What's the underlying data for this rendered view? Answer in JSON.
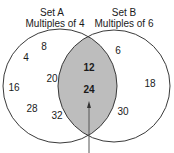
{
  "colors": {
    "circle_stroke": "#3a3a3a",
    "intersection_fill": "#bdbdbd",
    "background": "#ffffff",
    "arrow": "#555555"
  },
  "set_a": {
    "name": "Set A",
    "description": "Multiples of 4",
    "only_values": [
      "8",
      "4",
      "20",
      "16",
      "28",
      "32"
    ]
  },
  "set_b": {
    "name": "Set B",
    "description": "Multiples of 6",
    "only_values": [
      "6",
      "18",
      "30"
    ]
  },
  "intersection": {
    "values": [
      "12",
      "24"
    ],
    "arrow": "arrow pointing to intersection"
  }
}
